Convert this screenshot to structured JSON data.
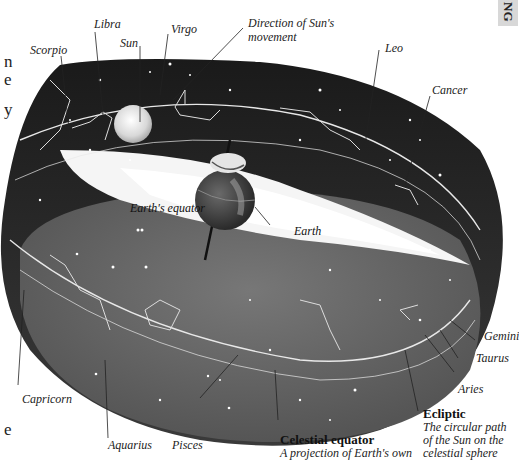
{
  "page_tab": {
    "text": "NG"
  },
  "left_edge_fragments": [
    "n",
    "e",
    "y",
    "e"
  ],
  "labels": {
    "scorpio": "Scorpio",
    "libra": "Libra",
    "sun": "Sun",
    "virgo": "Virgo",
    "direction_line1": "Direction of Sun's",
    "direction_line2": "movement",
    "leo": "Leo",
    "cancer": "Cancer",
    "earths_equator": "Earth's equator",
    "earth": "Earth",
    "gemini": "Gemini",
    "taurus": "Taurus",
    "aries": "Aries",
    "capricorn": "Capricorn",
    "aquarius": "Aquarius",
    "pisces": "Pisces"
  },
  "ecliptic": {
    "title": "Ecliptic",
    "desc_lines": [
      "The circular path",
      "of the Sun on the",
      "celestial sphere"
    ]
  },
  "celestial_equator": {
    "title": "Celestial equator",
    "desc_lines": [
      "A projection of Earth's own"
    ]
  },
  "colors": {
    "band_dark": "#1e1e1e",
    "band_inner": "#5a5a5a",
    "floor": "#6b6b6b",
    "line": "#e8e8e8",
    "leader": "#222222"
  }
}
